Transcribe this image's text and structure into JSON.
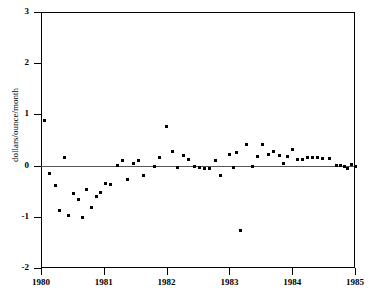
{
  "chart": {
    "title": "",
    "ylabel": "dollars/ounce/month",
    "xlabel": ""
  },
  "axes": {
    "y_ticks": [
      "3",
      "2",
      "1",
      "0",
      "-1",
      "-2"
    ],
    "x_ticks": [
      "1980",
      "1981",
      "1982",
      "1983",
      "1984",
      "1985"
    ]
  },
  "chart_data": {
    "type": "scatter",
    "title": "",
    "xlabel": "",
    "ylabel": "dollars/ounce/month",
    "xlim": [
      1980,
      1985
    ],
    "ylim": [
      -2,
      3
    ],
    "grid": false,
    "legend": null,
    "marker": "square",
    "marker_color": "#000000",
    "reference_line": {
      "y": 0,
      "color": "#555555",
      "style": "solid"
    },
    "x_tick_values": [
      1980,
      1981,
      1982,
      1983,
      1984,
      1985
    ],
    "y_tick_values": [
      3,
      2,
      1,
      0,
      -1,
      -2
    ],
    "points": [
      {
        "x": 1980.05,
        "y": 0.88
      },
      {
        "x": 1980.14,
        "y": -0.16
      },
      {
        "x": 1980.23,
        "y": -0.38
      },
      {
        "x": 1980.3,
        "y": -0.88
      },
      {
        "x": 1980.37,
        "y": 0.16
      },
      {
        "x": 1980.44,
        "y": -0.97
      },
      {
        "x": 1980.52,
        "y": -0.55
      },
      {
        "x": 1980.59,
        "y": -0.67
      },
      {
        "x": 1980.66,
        "y": -1.02
      },
      {
        "x": 1980.73,
        "y": -0.47
      },
      {
        "x": 1980.8,
        "y": -0.81
      },
      {
        "x": 1980.88,
        "y": -0.61
      },
      {
        "x": 1980.95,
        "y": -0.52
      },
      {
        "x": 1981.03,
        "y": -0.35
      },
      {
        "x": 1981.1,
        "y": -0.37
      },
      {
        "x": 1981.22,
        "y": 0.0
      },
      {
        "x": 1981.3,
        "y": 0.09
      },
      {
        "x": 1981.37,
        "y": -0.27
      },
      {
        "x": 1981.47,
        "y": 0.05
      },
      {
        "x": 1981.55,
        "y": 0.09
      },
      {
        "x": 1981.63,
        "y": -0.19
      },
      {
        "x": 1981.8,
        "y": -0.02
      },
      {
        "x": 1981.88,
        "y": 0.15
      },
      {
        "x": 1982.0,
        "y": 0.76
      },
      {
        "x": 1982.1,
        "y": 0.28
      },
      {
        "x": 1982.18,
        "y": -0.04
      },
      {
        "x": 1982.27,
        "y": 0.2
      },
      {
        "x": 1982.35,
        "y": 0.11
      },
      {
        "x": 1982.44,
        "y": -0.01
      },
      {
        "x": 1982.53,
        "y": -0.04
      },
      {
        "x": 1982.6,
        "y": -0.05
      },
      {
        "x": 1982.68,
        "y": -0.05
      },
      {
        "x": 1982.78,
        "y": 0.1
      },
      {
        "x": 1982.86,
        "y": -0.2
      },
      {
        "x": 1983.0,
        "y": 0.22
      },
      {
        "x": 1983.06,
        "y": -0.03
      },
      {
        "x": 1983.12,
        "y": 0.25
      },
      {
        "x": 1983.17,
        "y": -1.27
      },
      {
        "x": 1983.27,
        "y": 0.41
      },
      {
        "x": 1983.36,
        "y": -0.02
      },
      {
        "x": 1983.45,
        "y": 0.17
      },
      {
        "x": 1983.53,
        "y": 0.42
      },
      {
        "x": 1983.62,
        "y": 0.22
      },
      {
        "x": 1983.7,
        "y": 0.27
      },
      {
        "x": 1983.79,
        "y": 0.19
      },
      {
        "x": 1983.86,
        "y": 0.05
      },
      {
        "x": 1983.93,
        "y": 0.17
      },
      {
        "x": 1984.0,
        "y": 0.31
      },
      {
        "x": 1984.08,
        "y": 0.11
      },
      {
        "x": 1984.16,
        "y": 0.11
      },
      {
        "x": 1984.24,
        "y": 0.15
      },
      {
        "x": 1984.32,
        "y": 0.15
      },
      {
        "x": 1984.4,
        "y": 0.15
      },
      {
        "x": 1984.48,
        "y": 0.14
      },
      {
        "x": 1984.6,
        "y": 0.14
      },
      {
        "x": 1984.7,
        "y": 0.01
      },
      {
        "x": 1984.77,
        "y": 0.0
      },
      {
        "x": 1984.84,
        "y": -0.01
      },
      {
        "x": 1984.88,
        "y": -0.06
      },
      {
        "x": 1984.94,
        "y": 0.02
      },
      {
        "x": 1985.0,
        "y": -0.02
      }
    ]
  }
}
